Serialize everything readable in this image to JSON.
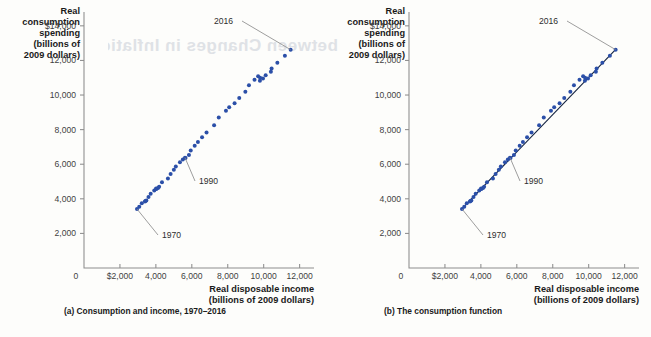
{
  "figure": {
    "ghost_text": "between Changes in Inflation",
    "y_axis_title_lines": [
      "Real",
      "consumption",
      "spending",
      "(billions of",
      "2009 dollars)"
    ],
    "x_axis_title_lines": [
      "Real disposable income",
      "(billions of 2009 dollars)"
    ],
    "y_ticks": [
      {
        "value": 14000,
        "label": "$14,000"
      },
      {
        "value": 12000,
        "label": "12,000"
      },
      {
        "value": 10000,
        "label": "10,000"
      },
      {
        "value": 8000,
        "label": "8,000"
      },
      {
        "value": 6000,
        "label": "6,000"
      },
      {
        "value": 4000,
        "label": "4,000"
      },
      {
        "value": 2000,
        "label": "2,000"
      }
    ],
    "x_ticks": [
      {
        "value": 2000,
        "label": "$2,000"
      },
      {
        "value": 4000,
        "label": "4,000"
      },
      {
        "value": 6000,
        "label": "6,000"
      },
      {
        "value": 8000,
        "label": "8,000"
      },
      {
        "value": 10000,
        "label": "10,000"
      },
      {
        "value": 12000,
        "label": "12,000"
      }
    ],
    "origin_label": "0",
    "point_color": "#2b4fa8",
    "line_color": "#12213f",
    "axis_color": "#8d8d8d",
    "annotations": [
      {
        "key": "y1970",
        "label": "1970"
      },
      {
        "key": "y1990",
        "label": "1990"
      },
      {
        "key": "y2016",
        "label": "2016"
      }
    ],
    "panels": [
      {
        "id": "a",
        "caption": "(a) Consumption and income, 1970–2016",
        "show_fit_line": false
      },
      {
        "id": "b",
        "caption": "(b) The consumption function",
        "show_fit_line": true
      }
    ]
  },
  "chart_data": {
    "type": "scatter",
    "title": "Consumption and income, 1970–2016",
    "xlabel": "Real disposable income (billions of 2009 dollars)",
    "ylabel": "Real consumption spending (billions of 2009 dollars)",
    "xlim": [
      0,
      12800
    ],
    "ylim": [
      0,
      14800
    ],
    "grid": false,
    "legend": "none",
    "series": [
      {
        "name": "Consumption vs. disposable income",
        "x_label": "Real disposable income",
        "y_label": "Real consumption spending",
        "points": [
          {
            "year": 1970,
            "x": 2950,
            "y": 3410
          },
          {
            "year": 1971,
            "x": 3075,
            "y": 3540
          },
          {
            "year": 1972,
            "x": 3215,
            "y": 3750
          },
          {
            "year": 1973,
            "x": 3420,
            "y": 3880
          },
          {
            "year": 1974,
            "x": 3390,
            "y": 3840
          },
          {
            "year": 1975,
            "x": 3470,
            "y": 3900
          },
          {
            "year": 1976,
            "x": 3590,
            "y": 4110
          },
          {
            "year": 1977,
            "x": 3710,
            "y": 4290
          },
          {
            "year": 1978,
            "x": 3910,
            "y": 4480
          },
          {
            "year": 1979,
            "x": 4010,
            "y": 4600
          },
          {
            "year": 1980,
            "x": 4030,
            "y": 4570
          },
          {
            "year": 1981,
            "x": 4120,
            "y": 4620
          },
          {
            "year": 1982,
            "x": 4180,
            "y": 4700
          },
          {
            "year": 1983,
            "x": 4340,
            "y": 4960
          },
          {
            "year": 1984,
            "x": 4670,
            "y": 5170
          },
          {
            "year": 1985,
            "x": 4820,
            "y": 5440
          },
          {
            "year": 1986,
            "x": 5000,
            "y": 5680
          },
          {
            "year": 1987,
            "x": 5110,
            "y": 5870
          },
          {
            "year": 1988,
            "x": 5340,
            "y": 6110
          },
          {
            "year": 1989,
            "x": 5500,
            "y": 6270
          },
          {
            "year": 1990,
            "x": 5620,
            "y": 6380
          },
          {
            "year": 1991,
            "x": 5650,
            "y": 6360
          },
          {
            "year": 1992,
            "x": 5840,
            "y": 6540
          },
          {
            "year": 1993,
            "x": 5940,
            "y": 6790
          },
          {
            "year": 1994,
            "x": 6160,
            "y": 7070
          },
          {
            "year": 1995,
            "x": 6340,
            "y": 7280
          },
          {
            "year": 1996,
            "x": 6570,
            "y": 7560
          },
          {
            "year": 1997,
            "x": 6820,
            "y": 7840
          },
          {
            "year": 1998,
            "x": 7240,
            "y": 8250
          },
          {
            "year": 1999,
            "x": 7500,
            "y": 8700
          },
          {
            "year": 2000,
            "x": 7900,
            "y": 9090
          },
          {
            "year": 2001,
            "x": 8080,
            "y": 9300
          },
          {
            "year": 2002,
            "x": 8380,
            "y": 9530
          },
          {
            "year": 2003,
            "x": 8640,
            "y": 9830
          },
          {
            "year": 2004,
            "x": 8980,
            "y": 10190
          },
          {
            "year": 2005,
            "x": 9180,
            "y": 10560
          },
          {
            "year": 2006,
            "x": 9490,
            "y": 10880
          },
          {
            "year": 2007,
            "x": 9690,
            "y": 11080
          },
          {
            "year": 2008,
            "x": 9800,
            "y": 11000
          },
          {
            "year": 2009,
            "x": 9790,
            "y": 10830
          },
          {
            "year": 2010,
            "x": 9960,
            "y": 10950
          },
          {
            "year": 2011,
            "x": 10110,
            "y": 11150
          },
          {
            "year": 2012,
            "x": 10400,
            "y": 11350
          },
          {
            "year": 2013,
            "x": 10440,
            "y": 11540
          },
          {
            "year": 2014,
            "x": 10760,
            "y": 11860
          },
          {
            "year": 2015,
            "x": 11180,
            "y": 12270
          },
          {
            "year": 2016,
            "x": 11500,
            "y": 12620
          }
        ]
      }
    ],
    "fit_line": {
      "name": "Consumption function",
      "x_start": 2900,
      "y_start": 3380,
      "x_end": 11560,
      "y_end": 12700,
      "shown_in_panel": "b"
    },
    "annotated_points": [
      {
        "label": "1970",
        "x": 2950,
        "y": 3410
      },
      {
        "label": "1990",
        "x": 5620,
        "y": 6380
      },
      {
        "label": "2016",
        "x": 11500,
        "y": 12620
      }
    ]
  }
}
